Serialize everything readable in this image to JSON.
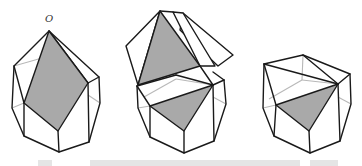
{
  "figure": {
    "vertex_label": "O",
    "panels": [
      {
        "id": "left",
        "description": "Polyhedron with shaded quadrilateral cross-section through apex O"
      },
      {
        "id": "middle",
        "description": "Polyhedron being unfolded, top pyramid section lifted and opened"
      },
      {
        "id": "right",
        "description": "Remaining polyhedron with shaded triangular cross-section"
      }
    ],
    "colors": {
      "edge": "#1a1a1a",
      "hidden_edge": "#b8b8b8",
      "shaded_face": "#a9a9a9",
      "background": "#ffffff"
    }
  },
  "caption": {
    "visible": "truncated"
  }
}
